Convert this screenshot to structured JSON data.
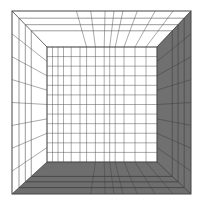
{
  "figure": {
    "outer": {
      "x1": 12,
      "y1": 11,
      "x2": 191,
      "y2": 194
    },
    "inner": {
      "x1": 47,
      "y1": 47,
      "x2": 157,
      "y2": 162
    },
    "colors": {
      "background": "#ffffff",
      "wall_white": "#ffffff",
      "floor": "#6e6e6e",
      "right_wall": "#707070",
      "grid_line": "#555555",
      "grid_line_light": "#9a9a9a",
      "outline": "#444444"
    },
    "back_wall": {
      "vertical_lines": 14,
      "horizontal_lines": 12
    },
    "left_wall": {
      "horizontal_lines": 8,
      "depth_lines": 3
    },
    "ceiling": {
      "converging_lines": 14,
      "depth_lines": 3
    },
    "floor": {
      "converging_lines": 14,
      "depth_lines": 3
    },
    "right_wall": {
      "horizontal_lines": 8,
      "depth_lines": 3
    }
  }
}
